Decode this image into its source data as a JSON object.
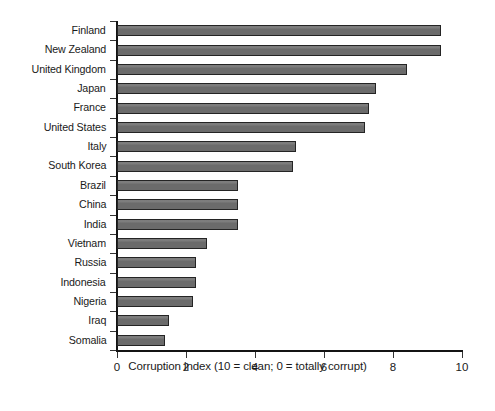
{
  "chart_data": {
    "type": "bar",
    "orientation": "horizontal",
    "title": "",
    "xlabel": "Corruption index (10 = clean; 0 = totally corrupt)",
    "ylabel": "",
    "xlim": [
      0,
      10
    ],
    "xticks": [
      0,
      2,
      4,
      6,
      8,
      10
    ],
    "xtick_labels": [
      "0",
      "2",
      "4",
      "6",
      "8",
      "10"
    ],
    "grid": false,
    "legend": false,
    "bar_color": "#6e6e6e",
    "bar_edge_color": "#242424",
    "background_color": "#ffffff",
    "categories": [
      "Finland",
      "New Zealand",
      "United Kingdom",
      "Japan",
      "France",
      "United States",
      "Italy",
      "South Korea",
      "Brazil",
      "China",
      "India",
      "Vietnam",
      "Russia",
      "Indonesia",
      "Nigeria",
      "Iraq",
      "Somalia"
    ],
    "values": [
      9.4,
      9.4,
      8.4,
      7.5,
      7.3,
      7.2,
      5.2,
      5.1,
      3.5,
      3.5,
      3.5,
      2.6,
      2.3,
      2.3,
      2.2,
      1.5,
      1.4
    ]
  }
}
